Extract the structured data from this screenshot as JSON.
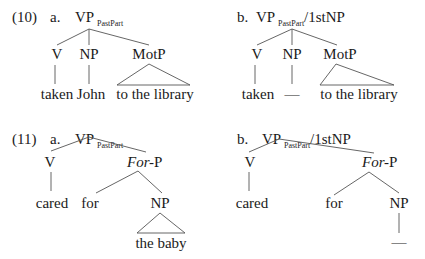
{
  "examples": [
    {
      "number": "(10)",
      "items": [
        {
          "letter": "a.",
          "root": {
            "label": "VP",
            "sub": "PastPart",
            "suffix": ""
          },
          "nodes": [
            "V",
            "NP",
            "MotP"
          ],
          "leaves": [
            "taken",
            "John",
            "to the library"
          ]
        },
        {
          "letter": "b.",
          "root": {
            "label": "VP",
            "sub": "PastPart",
            "suffix": "/1stNP"
          },
          "nodes": [
            "V",
            "NP",
            "MotP"
          ],
          "leaves": [
            "taken",
            "—",
            "to the library"
          ]
        }
      ]
    },
    {
      "number": "(11)",
      "items": [
        {
          "letter": "a.",
          "root": {
            "label": "VP",
            "sub": "PastPart",
            "suffix": ""
          },
          "nodes": [
            "V",
            "For",
            "-P"
          ],
          "leaves": [
            "cared",
            "for",
            "NP",
            "the baby"
          ]
        },
        {
          "letter": "b.",
          "root": {
            "label": "VP",
            "sub": "PastPart",
            "suffix": "/1stNP"
          },
          "nodes": [
            "V",
            "For",
            "-P"
          ],
          "leaves": [
            "cared",
            "for",
            "NP",
            "—"
          ]
        }
      ]
    }
  ]
}
